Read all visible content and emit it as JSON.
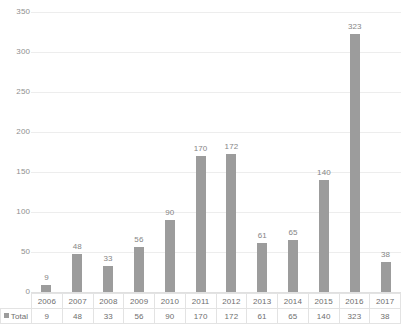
{
  "chart_data": {
    "type": "bar",
    "title": "",
    "subtitle": "",
    "xlabel": "",
    "ylabel": "",
    "categories": [
      "2006",
      "2007",
      "2008",
      "2009",
      "2010",
      "2011",
      "2012",
      "2013",
      "2014",
      "2015",
      "2016",
      "2017"
    ],
    "series": [
      {
        "name": "Total",
        "values": [
          9,
          48,
          33,
          56,
          90,
          170,
          172,
          61,
          65,
          140,
          323,
          38
        ],
        "color": "#9c9c9c"
      }
    ],
    "values": [
      9,
      48,
      33,
      56,
      90,
      170,
      172,
      61,
      65,
      140,
      323,
      38
    ],
    "data_labels": [
      "9",
      "48",
      "33",
      "56",
      "90",
      "170",
      "172",
      "61",
      "65",
      "140",
      "323",
      "38"
    ],
    "ylim": [
      0,
      350
    ],
    "ytick_values": [
      0,
      50,
      100,
      150,
      200,
      250,
      300,
      350
    ],
    "ytick_labels": [
      "0",
      "50",
      "100",
      "150",
      "200",
      "250",
      "300",
      "350"
    ],
    "grid": true,
    "grid_axis": "y",
    "legend": {
      "visible": true,
      "position": "data-table",
      "entries": [
        "Total"
      ]
    },
    "data_table": {
      "visible": true,
      "row_header": "Total",
      "column_headers": [
        "2006",
        "2007",
        "2008",
        "2009",
        "2010",
        "2011",
        "2012",
        "2013",
        "2014",
        "2015",
        "2016",
        "2017"
      ],
      "row_values": [
        "9",
        "48",
        "33",
        "56",
        "90",
        "170",
        "172",
        "61",
        "65",
        "140",
        "323",
        "38"
      ]
    },
    "colors": {
      "bar": "#9c9c9c",
      "gridline": "#ededed",
      "axis_text": "#8f8f8f",
      "label_text": "#858585",
      "table_border": "#e3e3e3",
      "background": "#ffffff"
    }
  }
}
